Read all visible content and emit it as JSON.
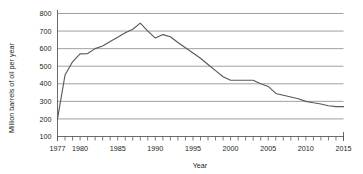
{
  "chart_data": {
    "type": "line",
    "title": "",
    "xlabel": "Year",
    "ylabel": "Million barrels of oil per year",
    "xlim": [
      1977,
      2015
    ],
    "ylim": [
      100,
      800
    ],
    "grid": true,
    "legend": null,
    "y_ticks": [
      100,
      200,
      300,
      400,
      500,
      600,
      700,
      800
    ],
    "y_tick_labels": [
      "100",
      "200",
      "300",
      "400",
      "500",
      "600",
      "700",
      "800"
    ],
    "x_ticks": [
      1977,
      1980,
      1985,
      1990,
      1995,
      2000,
      2005,
      2010,
      2015
    ],
    "x_tick_labels": [
      "1977",
      "1980",
      "1985",
      "1990",
      "1995",
      "2000",
      "2005",
      "2010",
      "2015"
    ],
    "x_minor_ticks_every": 1,
    "series": [
      {
        "name": "Oil production",
        "color": "#58595b",
        "x": [
          1977,
          1978,
          1979,
          1980,
          1981,
          1982,
          1983,
          1984,
          1985,
          1986,
          1987,
          1988,
          1989,
          1990,
          1991,
          1992,
          1993,
          1994,
          1995,
          1996,
          1997,
          1998,
          1999,
          2000,
          2001,
          2002,
          2003,
          2004,
          2005,
          2006,
          2007,
          2008,
          2009,
          2010,
          2011,
          2012,
          2013,
          2014,
          2015
        ],
        "values": [
          200,
          450,
          525,
          570,
          572,
          600,
          615,
          640,
          665,
          690,
          710,
          745,
          700,
          660,
          680,
          668,
          635,
          605,
          575,
          545,
          510,
          475,
          440,
          420,
          420,
          420,
          420,
          400,
          385,
          345,
          335,
          325,
          315,
          300,
          292,
          285,
          275,
          270,
          270
        ]
      }
    ]
  }
}
